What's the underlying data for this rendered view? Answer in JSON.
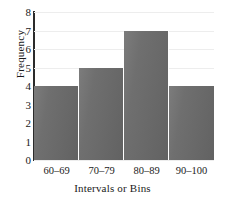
{
  "chart_data": {
    "type": "bar",
    "title": "",
    "subtitle": "",
    "xlabel": "Intervals or Bins",
    "ylabel": "Frequency",
    "categories": [
      "60–69",
      "70–79",
      "80–89",
      "90–100"
    ],
    "values": [
      4,
      5,
      7,
      4
    ],
    "ylim": [
      0,
      8
    ],
    "yticks": [
      8,
      7,
      6,
      5,
      4,
      3,
      2,
      1,
      0
    ],
    "grid": true,
    "legend": null,
    "annotations": [],
    "bar_color": "#6e6e6e",
    "axis_color": "#2b2b2b",
    "gridline_color": "#ededed",
    "background_color": "#ffffff"
  }
}
